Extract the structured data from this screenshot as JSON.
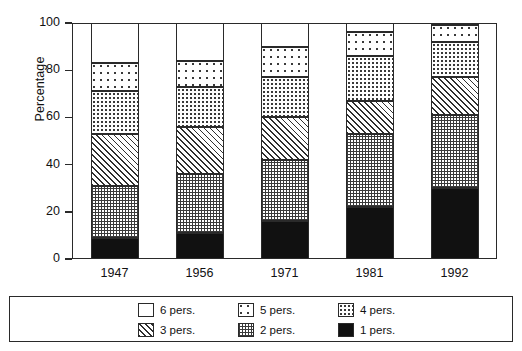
{
  "chart_data": {
    "type": "bar",
    "subtype": "stacked-100-percent",
    "title": "",
    "xlabel": "",
    "ylabel": "Percentage",
    "categories": [
      "1947",
      "1956",
      "1971",
      "1981",
      "1992"
    ],
    "ylim": [
      0,
      100
    ],
    "yticks": [
      0,
      20,
      40,
      60,
      80,
      100
    ],
    "ytick_labels": [
      "0",
      "20",
      "40",
      "60",
      "80",
      "100"
    ],
    "grid": false,
    "legend_position": "bottom",
    "series": [
      {
        "name": "1 pers.",
        "pattern": "solid-black",
        "values": [
          9,
          11,
          16,
          22,
          30
        ]
      },
      {
        "name": "2 pers.",
        "pattern": "fine-grid",
        "values": [
          22,
          25,
          26,
          31,
          31
        ]
      },
      {
        "name": "3 pers.",
        "pattern": "diagonal-hatch",
        "values": [
          22,
          20,
          18,
          14,
          16
        ]
      },
      {
        "name": "4 pers.",
        "pattern": "dense-dots",
        "values": [
          18,
          17,
          17,
          19,
          15
        ]
      },
      {
        "name": "5 pers.",
        "pattern": "sparse-dots",
        "values": [
          12,
          11,
          13,
          10,
          7
        ]
      },
      {
        "name": "6 pers.",
        "pattern": "blank-white",
        "values": [
          17,
          16,
          10,
          4,
          1
        ]
      }
    ],
    "cumulative_tops": {
      "1947": [
        9,
        31,
        53,
        71,
        83,
        100
      ],
      "1956": [
        11,
        36,
        56,
        73,
        84,
        100
      ],
      "1971": [
        16,
        42,
        60,
        77,
        90,
        100
      ],
      "1981": [
        22,
        53,
        67,
        86,
        96,
        100
      ],
      "1992": [
        30,
        61,
        77,
        92,
        99,
        100
      ]
    }
  },
  "legend": {
    "items": [
      {
        "label": "6 pers.",
        "pattern": "blank-white"
      },
      {
        "label": "5 pers.",
        "pattern": "sparse-dots"
      },
      {
        "label": "4 pers.",
        "pattern": "dense-dots"
      },
      {
        "label": "3 pers.",
        "pattern": "diagonal-hatch"
      },
      {
        "label": "2 pers.",
        "pattern": "fine-grid"
      },
      {
        "label": "1 pers.",
        "pattern": "solid-black"
      }
    ]
  },
  "colors": {
    "axis": "#2a2a2a",
    "text": "#111111",
    "ink": "#3a3a3a",
    "background": "#ffffff",
    "solid_fill": "#111111"
  }
}
